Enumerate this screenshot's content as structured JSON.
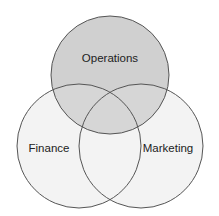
{
  "diagram": {
    "type": "venn",
    "sets": [
      {
        "label": "Operations",
        "cx": 110,
        "cy": 75,
        "r": 59,
        "fill": "#d0d0d0"
      },
      {
        "label": "Finance",
        "cx": 79,
        "cy": 146,
        "r": 62,
        "fill": "#f2f2f2"
      },
      {
        "label": "Marketing",
        "cx": 141,
        "cy": 146,
        "r": 62,
        "fill": "#f2f2f2"
      }
    ],
    "stroke": "#555555"
  }
}
